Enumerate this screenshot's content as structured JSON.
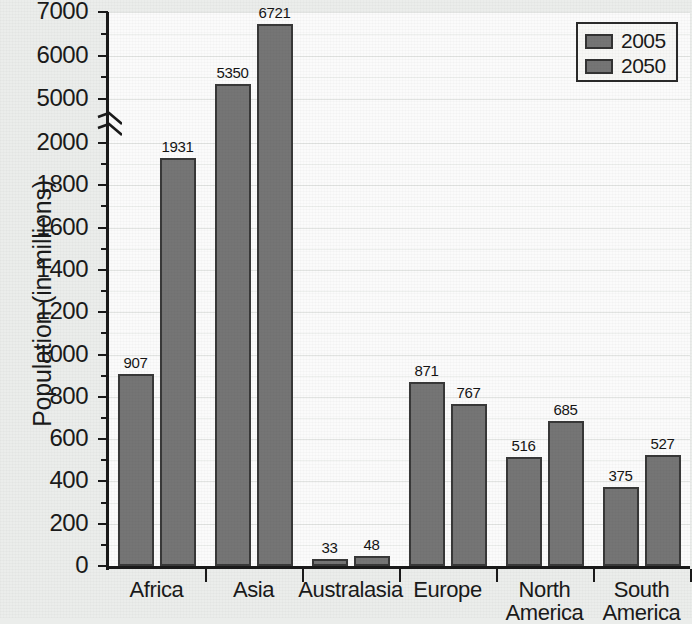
{
  "chart_data": {
    "type": "bar",
    "title": "",
    "xlabel": "",
    "ylabel": "Population (in millions)",
    "categories": [
      "Africa",
      "Asia",
      "Australasia",
      "Europe",
      "North America",
      "South America"
    ],
    "series": [
      {
        "name": "2005",
        "values": [
          907,
          5350,
          33,
          871,
          516,
          375
        ]
      },
      {
        "name": "2050",
        "values": [
          1931,
          6721,
          48,
          767,
          685,
          527
        ]
      }
    ],
    "legend_position": "top-right",
    "grid": true,
    "broken_axis": true,
    "axis_segments": [
      {
        "min": 0,
        "max": 2000,
        "major_step": 200,
        "minor_step": 100
      },
      {
        "min": 5000,
        "max": 7000,
        "major_step": 1000,
        "minor_step": 500
      }
    ],
    "ylim": [
      0,
      7000
    ],
    "y_major_ticks": [
      0,
      200,
      400,
      600,
      800,
      1000,
      1200,
      1400,
      1600,
      1800,
      2000,
      5000,
      6000,
      7000
    ],
    "y_tick_labels": [
      "0",
      "200",
      "400",
      "600",
      "800",
      "1000",
      "1200",
      "1400",
      "1600",
      "1800",
      "2000",
      "5000",
      "6000",
      "7000"
    ],
    "bar_color": "#757575",
    "bar_border_color": "#383838",
    "plot_background": "#fbfbfb",
    "page_background": "#ebedeb"
  },
  "axis": {
    "y_title": "Population (in millions)"
  },
  "legend": {
    "items": [
      {
        "label": "2005",
        "color": "#757575"
      },
      {
        "label": "2050",
        "color": "#757575"
      }
    ]
  },
  "categories": [
    {
      "label": "Africa",
      "line1": "Africa",
      "line2": ""
    },
    {
      "label": "Asia",
      "line1": "Asia",
      "line2": ""
    },
    {
      "label": "Australasia",
      "line1": "Australasia",
      "line2": ""
    },
    {
      "label": "Europe",
      "line1": "Europe",
      "line2": ""
    },
    {
      "label": "North America",
      "line1": "North",
      "line2": "America"
    },
    {
      "label": "South America",
      "line1": "South",
      "line2": "America"
    }
  ]
}
